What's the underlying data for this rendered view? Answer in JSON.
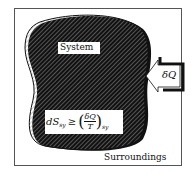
{
  "labels": {
    "system": "System",
    "surroundings": "Surroundings",
    "heat": "δQ",
    "equation_lhs": "dS",
    "equation_sub": "sy",
    "equation_op": "≥",
    "equation_num": "δQ",
    "equation_den": "T",
    "equation_rsub": "sy"
  },
  "colors": {
    "ink": "#111111",
    "hatch": "#9a9a9a",
    "background": "#ffffff"
  }
}
